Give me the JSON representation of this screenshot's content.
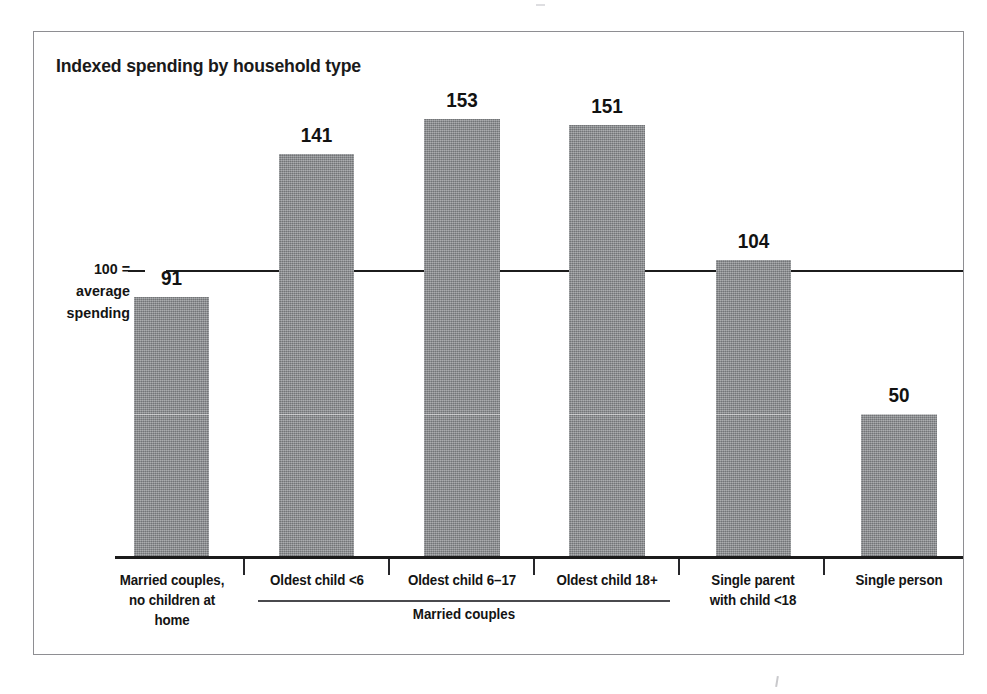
{
  "figure": {
    "title": "Indexed spending by household type",
    "axis_annotation_lines": [
      "100 =",
      "average",
      "spending"
    ],
    "group_bracket_label": "Married couples",
    "bar_color": "#8b8d90",
    "axis_color": "#1b1b1b",
    "reference_line_color": "#1c1c1c",
    "frame_color": "#8e8e92",
    "text_color": "#141414"
  },
  "chart_data": {
    "type": "bar",
    "title": "Indexed spending by household type",
    "xlabel": "",
    "ylabel": "100 = average spending",
    "ylim": [
      0,
      165
    ],
    "grid": false,
    "legend": "none",
    "reference_line": {
      "value": 100,
      "label": "100 = average spending"
    },
    "categories": [
      "Married couples, no children at home",
      "Oldest child <6",
      "Oldest child 6–17",
      "Oldest child 18+",
      "Single parent with child <18",
      "Single person"
    ],
    "category_label_lines": [
      [
        "Married couples,",
        "no children at home"
      ],
      [
        "Oldest child <6"
      ],
      [
        "Oldest child 6–17"
      ],
      [
        "Oldest child 18+"
      ],
      [
        "Single parent",
        "with child <18"
      ],
      [
        "Single person"
      ]
    ],
    "values": [
      91,
      141,
      153,
      151,
      104,
      50
    ],
    "value_labels": [
      "91",
      "141",
      "153",
      "151",
      "104",
      "50"
    ],
    "groups": [
      {
        "label": "Married couples",
        "member_categories": [
          "Oldest child <6",
          "Oldest child 6–17",
          "Oldest child 18+"
        ]
      }
    ]
  }
}
